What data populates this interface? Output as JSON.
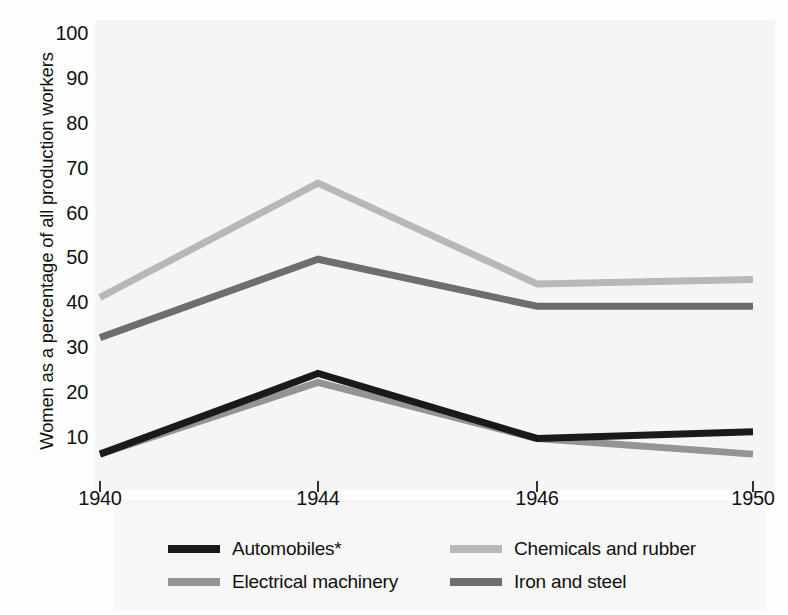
{
  "chart_data": {
    "type": "line",
    "title": "",
    "xlabel": "",
    "ylabel": "Women as a percentage of all production workers",
    "categories": [
      "1940",
      "1944",
      "1946",
      "1950"
    ],
    "ylim": [
      0,
      100
    ],
    "yticks": [
      10,
      20,
      30,
      40,
      50,
      60,
      70,
      80,
      90,
      100
    ],
    "ytick_labels": [
      "10",
      "20",
      "30",
      "40",
      "50",
      "60",
      "70",
      "80",
      "90",
      "100"
    ],
    "grid": false,
    "legend_position": "bottom",
    "series": [
      {
        "name": "Automobiles*",
        "color": "#1a1a1a",
        "values": [
          6,
          24,
          9.5,
          11
        ]
      },
      {
        "name": "Chemicals and rubber",
        "color": "#b8b8b8",
        "values": [
          41,
          66.5,
          44,
          45
        ]
      },
      {
        "name": "Electrical machinery",
        "color": "#949494",
        "values": [
          6,
          22,
          9.5,
          6
        ]
      },
      {
        "name": "Iron and steel",
        "color": "#6e6e6e",
        "values": [
          32,
          49.5,
          39,
          39
        ]
      }
    ]
  },
  "axis": {
    "y_title": "Women as a percentage of all production workers",
    "y_labels": [
      "100",
      "90",
      "80",
      "70",
      "60",
      "50",
      "40",
      "30",
      "20",
      "10"
    ],
    "x_labels": [
      "1940",
      "1944",
      "1946",
      "1950"
    ]
  },
  "legend": {
    "entries": [
      {
        "label": "Automobiles*",
        "color": "#1a1a1a"
      },
      {
        "label": "Chemicals and rubber",
        "color": "#b8b8b8"
      },
      {
        "label": "Electrical machinery",
        "color": "#949494"
      },
      {
        "label": "Iron and steel",
        "color": "#6e6e6e"
      }
    ]
  }
}
